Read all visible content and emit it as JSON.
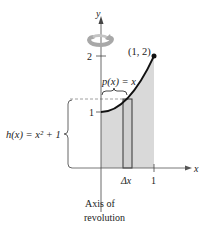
{
  "figure": {
    "axes": {
      "x_label": "x",
      "y_label": "y",
      "x_ticks": [
        "1"
      ],
      "y_ticks": [
        "1",
        "2"
      ]
    },
    "point_label": "(1, 2)",
    "radius_label": "p(x) = x",
    "height_label": "h(x) = x² + 1",
    "strip_label": "Δx",
    "axis_of_revolution_line1": "Axis of",
    "axis_of_revolution_line2": "revolution",
    "colors": {
      "shading": "#d9d9d9",
      "curve": "#111111",
      "axis": "#444444",
      "rotation_arrow": "#a8a8a8",
      "dashed": "#888888"
    }
  }
}
